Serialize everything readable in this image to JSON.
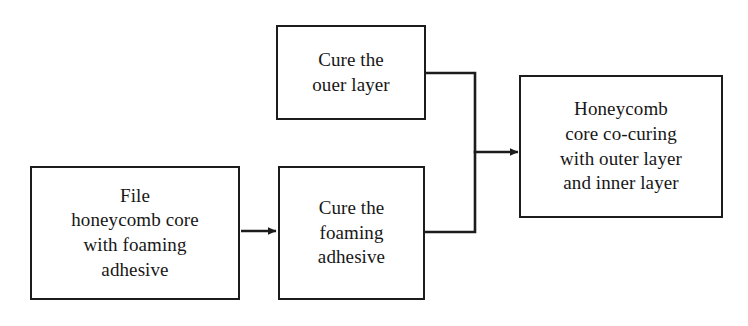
{
  "diagram": {
    "background_color": "#ffffff",
    "line_color": "#1c1c1c",
    "text_color": "#171717",
    "nodes": [
      {
        "id": "cure-outer",
        "label": "Cure the\nouer layer",
        "x": 276,
        "y": 25,
        "width": 150,
        "height": 95
      },
      {
        "id": "file-core",
        "label": "File\nhoneycomb core\nwith foaming\nadhesive",
        "x": 30,
        "y": 166,
        "width": 210,
        "height": 134
      },
      {
        "id": "cure-foam",
        "label": "Cure the\nfoaming\nadhesive",
        "x": 278,
        "y": 166,
        "width": 147,
        "height": 134
      },
      {
        "id": "cocuring",
        "label": "Honeycomb\ncore co-curing\nwith outer layer\nand inner layer",
        "x": 519,
        "y": 75,
        "width": 204,
        "height": 143
      }
    ],
    "edges": [
      {
        "id": "edge-file-to-foam",
        "from": "file-core",
        "to": "cure-foam",
        "arrow": true
      },
      {
        "id": "edge-outer-to-merge",
        "from": "cure-outer",
        "to": "merge-junction",
        "arrow": false
      },
      {
        "id": "edge-foam-to-merge",
        "from": "cure-foam",
        "to": "merge-junction",
        "arrow": false
      },
      {
        "id": "edge-merge-to-cocuring",
        "from": "merge-junction",
        "to": "cocuring",
        "arrow": true
      }
    ]
  }
}
